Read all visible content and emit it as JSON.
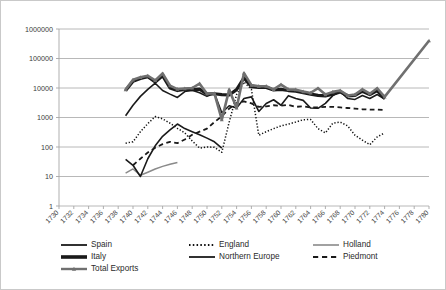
{
  "figure": {
    "border_color": "#c9c9c9",
    "plot_bg": "#ffffff",
    "gridline_color": "#a6a6a6"
  },
  "chart_data": {
    "type": "line",
    "title": "",
    "subtitle": "",
    "xlabel": "",
    "ylabel": "",
    "yscale": "log",
    "ylim": [
      1,
      1000000
    ],
    "ytick_labels": [
      "1",
      "10",
      "100",
      "1000",
      "10000",
      "100000",
      "1000000"
    ],
    "ytick_values": [
      1,
      10,
      100,
      1000,
      10000,
      100000,
      1000000
    ],
    "grid": true,
    "legend_position": "bottom",
    "x": [
      1730,
      1732,
      1734,
      1736,
      1738,
      1740,
      1742,
      1744,
      1746,
      1748,
      1750,
      1752,
      1754,
      1756,
      1758,
      1760,
      1762,
      1764,
      1766,
      1768,
      1770,
      1772,
      1774,
      1776,
      1778,
      1780
    ],
    "xtick_labels": [
      "1730",
      "1732",
      "1734",
      "1736",
      "1738",
      "1740",
      "1742",
      "1744",
      "1746",
      "1748",
      "1750",
      "1752",
      "1754",
      "1756",
      "1758",
      "1760",
      "1762",
      "1764",
      "1766",
      "1768",
      "1770",
      "1772",
      "1774",
      "1776",
      "1778",
      "1780"
    ],
    "xlim": [
      1730,
      1780
    ],
    "series": [
      {
        "name": "Spain",
        "color": "#1a1a1a",
        "style": "solid",
        "width": 1.6,
        "marker": "none",
        "points": [
          [
            1739,
            1150
          ],
          [
            1740,
            2600
          ],
          [
            1741,
            5200
          ],
          [
            1742,
            9000
          ],
          [
            1743,
            14500
          ],
          [
            1744,
            8200
          ],
          [
            1745,
            6200
          ],
          [
            1746,
            4800
          ],
          [
            1747,
            7600
          ],
          [
            1748,
            8400
          ],
          [
            1749,
            6900
          ],
          [
            1750,
            5200
          ],
          [
            1751,
            6600
          ],
          [
            1752,
            1450
          ],
          [
            1753,
            2500
          ],
          [
            1754,
            2100
          ],
          [
            1755,
            4400
          ],
          [
            1756,
            5000
          ],
          [
            1757,
            1600
          ],
          [
            1758,
            3000
          ],
          [
            1759,
            4000
          ],
          [
            1760,
            2600
          ],
          [
            1761,
            5500
          ],
          [
            1762,
            4400
          ],
          [
            1763,
            3800
          ],
          [
            1764,
            2100
          ],
          [
            1765,
            2050
          ],
          [
            1766,
            3000
          ],
          [
            1767,
            5500
          ],
          [
            1768,
            7500
          ],
          [
            1769,
            4400
          ],
          [
            1770,
            4100
          ],
          [
            1771,
            5600
          ],
          [
            1772,
            4400
          ],
          [
            1773,
            6000
          ],
          [
            1774,
            4200
          ]
        ]
      },
      {
        "name": "England",
        "color": "#111111",
        "style": "dotted",
        "width": 1.5,
        "marker": "none",
        "points": [
          [
            1739,
            135
          ],
          [
            1740,
            150
          ],
          [
            1741,
            330
          ],
          [
            1742,
            620
          ],
          [
            1743,
            1080
          ],
          [
            1744,
            900
          ],
          [
            1745,
            640
          ],
          [
            1746,
            430
          ],
          [
            1747,
            300
          ],
          [
            1748,
            160
          ],
          [
            1749,
            92
          ],
          [
            1750,
            100
          ],
          [
            1751,
            98
          ],
          [
            1752,
            66
          ],
          [
            1753,
            700
          ],
          [
            1754,
            6000
          ],
          [
            1755,
            16000
          ],
          [
            1756,
            9000
          ],
          [
            1757,
            250
          ],
          [
            1758,
            330
          ],
          [
            1759,
            420
          ],
          [
            1760,
            520
          ],
          [
            1761,
            600
          ],
          [
            1762,
            700
          ],
          [
            1763,
            840
          ],
          [
            1764,
            860
          ],
          [
            1765,
            420
          ],
          [
            1766,
            300
          ],
          [
            1767,
            640
          ],
          [
            1768,
            700
          ],
          [
            1769,
            520
          ],
          [
            1770,
            250
          ],
          [
            1771,
            170
          ],
          [
            1772,
            120
          ],
          [
            1773,
            220
          ],
          [
            1774,
            300
          ]
        ]
      },
      {
        "name": "Holland",
        "color": "#8a8a8a",
        "style": "solid",
        "width": 1.5,
        "marker": "none",
        "points": [
          [
            1739,
            13
          ],
          [
            1740,
            18
          ],
          [
            1741,
            11
          ],
          [
            1742,
            14
          ],
          [
            1743,
            18
          ],
          [
            1744,
            22
          ],
          [
            1745,
            26
          ],
          [
            1746,
            30
          ]
        ]
      },
      {
        "name": "Italy",
        "color": "#1a1a1a",
        "style": "solid",
        "width": 3.2,
        "marker": "none",
        "points": [
          [
            1739,
            8200
          ],
          [
            1740,
            17000
          ],
          [
            1741,
            21000
          ],
          [
            1742,
            24000
          ],
          [
            1743,
            16000
          ],
          [
            1744,
            26000
          ],
          [
            1745,
            10000
          ],
          [
            1746,
            8200
          ],
          [
            1747,
            9000
          ],
          [
            1748,
            8800
          ],
          [
            1749,
            9200
          ],
          [
            1750,
            6200
          ],
          [
            1751,
            6400
          ],
          [
            1752,
            6000
          ],
          [
            1753,
            5800
          ],
          [
            1754,
            8800
          ],
          [
            1755,
            22000
          ],
          [
            1756,
            11000
          ],
          [
            1757,
            10500
          ],
          [
            1758,
            10500
          ],
          [
            1759,
            8600
          ],
          [
            1760,
            9000
          ],
          [
            1761,
            8200
          ],
          [
            1762,
            7800
          ],
          [
            1763,
            7000
          ],
          [
            1764,
            6200
          ],
          [
            1765,
            5600
          ],
          [
            1766,
            5400
          ],
          [
            1767,
            6200
          ],
          [
            1768,
            7400
          ],
          [
            1769,
            5400
          ],
          [
            1770,
            5600
          ],
          [
            1771,
            7800
          ],
          [
            1772,
            6000
          ],
          [
            1773,
            8200
          ],
          [
            1774,
            4400
          ]
        ]
      },
      {
        "name": "Northern Europe",
        "color": "#1a1a1a",
        "style": "solid",
        "width": 1.6,
        "marker": "none",
        "points": [
          [
            1739,
            38
          ],
          [
            1740,
            24
          ],
          [
            1741,
            10
          ],
          [
            1742,
            40
          ],
          [
            1743,
            110
          ],
          [
            1744,
            230
          ],
          [
            1745,
            380
          ],
          [
            1746,
            600
          ],
          [
            1747,
            420
          ],
          [
            1748,
            330
          ],
          [
            1749,
            260
          ],
          [
            1750,
            200
          ],
          [
            1751,
            150
          ],
          [
            1752,
            92
          ]
        ]
      },
      {
        "name": "Piedmont",
        "color": "#1a1a1a",
        "style": "dashed",
        "width": 1.8,
        "marker": "none",
        "points": [
          [
            1740,
            24
          ],
          [
            1741,
            40
          ],
          [
            1742,
            65
          ],
          [
            1743,
            95
          ],
          [
            1744,
            125
          ],
          [
            1745,
            150
          ],
          [
            1746,
            135
          ],
          [
            1747,
            180
          ],
          [
            1748,
            260
          ],
          [
            1749,
            330
          ],
          [
            1750,
            420
          ],
          [
            1751,
            700
          ],
          [
            1752,
            1100
          ],
          [
            1753,
            2000
          ],
          [
            1754,
            3100
          ],
          [
            1755,
            3500
          ],
          [
            1756,
            3000
          ],
          [
            1757,
            2300
          ],
          [
            1758,
            2400
          ],
          [
            1759,
            2600
          ],
          [
            1760,
            2500
          ],
          [
            1761,
            2700
          ],
          [
            1762,
            2300
          ],
          [
            1763,
            2400
          ],
          [
            1764,
            2200
          ],
          [
            1765,
            2200
          ],
          [
            1766,
            2300
          ],
          [
            1767,
            2300
          ],
          [
            1768,
            2200
          ],
          [
            1769,
            2100
          ],
          [
            1770,
            2000
          ],
          [
            1771,
            1900
          ],
          [
            1772,
            1850
          ],
          [
            1773,
            1850
          ],
          [
            1774,
            1800
          ]
        ]
      },
      {
        "name": "Total Exports",
        "color": "#707070",
        "style": "solid",
        "width": 2.6,
        "marker": "triangle",
        "points": [
          [
            1739,
            8800
          ],
          [
            1740,
            19000
          ],
          [
            1741,
            23000
          ],
          [
            1742,
            26000
          ],
          [
            1743,
            18000
          ],
          [
            1744,
            31000
          ],
          [
            1745,
            12000
          ],
          [
            1746,
            9200
          ],
          [
            1747,
            9600
          ],
          [
            1748,
            10000
          ],
          [
            1749,
            14000
          ],
          [
            1750,
            6400
          ],
          [
            1751,
            6600
          ],
          [
            1752,
            850
          ],
          [
            1753,
            8800
          ],
          [
            1754,
            2100
          ],
          [
            1755,
            32000
          ],
          [
            1756,
            12500
          ],
          [
            1757,
            11500
          ],
          [
            1758,
            11500
          ],
          [
            1759,
            9000
          ],
          [
            1760,
            13000
          ],
          [
            1761,
            9000
          ],
          [
            1762,
            8800
          ],
          [
            1763,
            7600
          ],
          [
            1764,
            6800
          ],
          [
            1765,
            9800
          ],
          [
            1766,
            6000
          ],
          [
            1767,
            7400
          ],
          [
            1768,
            8200
          ],
          [
            1769,
            5600
          ],
          [
            1770,
            6000
          ],
          [
            1771,
            9000
          ],
          [
            1772,
            6400
          ],
          [
            1773,
            9800
          ],
          [
            1774,
            5000
          ],
          [
            1780,
            400000
          ]
        ]
      }
    ]
  },
  "legend": {
    "entries": [
      {
        "label": "Spain",
        "color": "#1a1a1a",
        "style": "solid",
        "width": 1.8
      },
      {
        "label": "England",
        "color": "#111111",
        "style": "dotted",
        "width": 1.8
      },
      {
        "label": "Holland",
        "color": "#8a8a8a",
        "style": "solid",
        "width": 1.6
      },
      {
        "label": "Italy",
        "color": "#1a1a1a",
        "style": "solid",
        "width": 3.6
      },
      {
        "label": "Northern Europe",
        "color": "#1a1a1a",
        "style": "solid",
        "width": 1.8
      },
      {
        "label": "Piedmont",
        "color": "#1a1a1a",
        "style": "dashed",
        "width": 2.0
      },
      {
        "label": "Total Exports",
        "color": "#707070",
        "style": "solid",
        "width": 2.4
      }
    ]
  }
}
